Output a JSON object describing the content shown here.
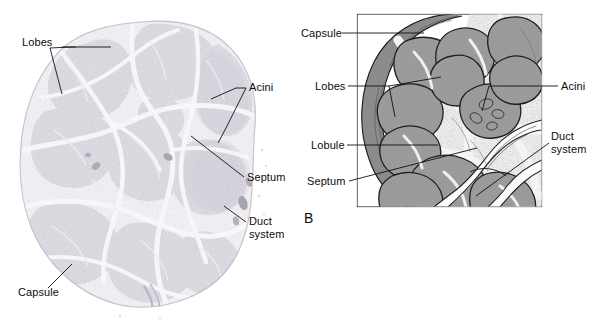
{
  "figure": {
    "panels": [
      {
        "id": "A",
        "kind": "light-micrograph",
        "letter": "",
        "description": "Low-power photomicrograph of a sectioned gland",
        "labels": [
          {
            "name": "lobes",
            "text": "Lobes",
            "x": 22,
            "y": 36,
            "align": "left"
          },
          {
            "name": "acini",
            "text": "Acini",
            "x": 249,
            "y": 87,
            "align": "left"
          },
          {
            "name": "septum",
            "text": "Septum",
            "x": 247,
            "y": 174,
            "align": "left"
          },
          {
            "name": "duct-system",
            "text": "Duct\nsystem",
            "x": 249,
            "y": 219,
            "align": "left"
          },
          {
            "name": "capsule",
            "text": "Capsule",
            "x": 18,
            "y": 291,
            "align": "left"
          }
        ]
      },
      {
        "id": "B",
        "kind": "line-drawing",
        "letter": "B",
        "description": "Schematic drawing of the same gland showing capsule, lobes, lobules, septa, acini and duct system",
        "frame": {
          "x": 357,
          "y": 14,
          "width": 185,
          "height": 193
        },
        "labels": [
          {
            "name": "capsule",
            "text": "Capsule",
            "x": 301,
            "y": 28,
            "align": "left"
          },
          {
            "name": "lobes",
            "text": "Lobes",
            "x": 315,
            "y": 80,
            "align": "left"
          },
          {
            "name": "lobule",
            "text": "Lobule",
            "x": 311,
            "y": 140,
            "align": "left"
          },
          {
            "name": "septum",
            "text": "Septum",
            "x": 307,
            "y": 175,
            "align": "left"
          },
          {
            "name": "acini",
            "text": "Acini",
            "x": 561,
            "y": 80,
            "align": "left"
          },
          {
            "name": "duct-system",
            "text": "Duct\nsystem",
            "x": 551,
            "y": 135,
            "align": "left"
          }
        ]
      }
    ],
    "colors": {
      "background": "#ffffff",
      "text": "#0d0d0d",
      "leader_line": "#111111",
      "frame": "#000000",
      "micrograph_tissue": "#c9c6cf",
      "micrograph_septum": "#f2f1f4",
      "drawing_parenchyma": "#8d8d8d",
      "drawing_capsule": "#6f6f6f",
      "drawing_septum": "#efefef",
      "drawing_outline": "#1a1a1a"
    }
  }
}
